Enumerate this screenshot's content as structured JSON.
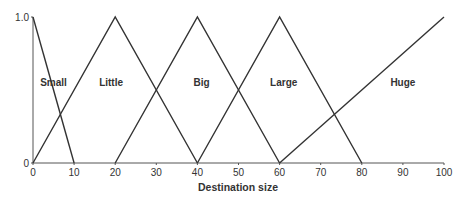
{
  "chart_data": {
    "type": "line",
    "title": "",
    "xlabel": "Destination size",
    "ylabel": "",
    "xlim": [
      0,
      100
    ],
    "ylim": [
      0,
      1.0
    ],
    "grid": false,
    "x_ticks": [
      "0",
      "10",
      "20",
      "30",
      "40",
      "50",
      "60",
      "70",
      "80",
      "90",
      "100"
    ],
    "y_ticks": [
      "0",
      "1.0"
    ],
    "series": [
      {
        "name": "Small",
        "points": [
          [
            0,
            1.0
          ],
          [
            10,
            0
          ]
        ],
        "label_pos": [
          5,
          0.55
        ]
      },
      {
        "name": "Little",
        "points": [
          [
            0,
            0
          ],
          [
            20,
            1.0
          ],
          [
            40,
            0
          ]
        ],
        "label_pos": [
          19,
          0.55
        ]
      },
      {
        "name": "Big",
        "points": [
          [
            20,
            0
          ],
          [
            40,
            1.0
          ],
          [
            60,
            0
          ]
        ],
        "label_pos": [
          41,
          0.55
        ]
      },
      {
        "name": "Large",
        "points": [
          [
            40,
            0
          ],
          [
            60,
            1.0
          ],
          [
            80,
            0
          ]
        ],
        "label_pos": [
          61,
          0.55
        ]
      },
      {
        "name": "Huge",
        "points": [
          [
            60,
            0
          ],
          [
            100,
            1.0
          ]
        ],
        "label_pos": [
          90,
          0.55
        ]
      }
    ],
    "legend": "inline labels"
  },
  "colors": {
    "line": "#333333",
    "axis": "#555555"
  }
}
